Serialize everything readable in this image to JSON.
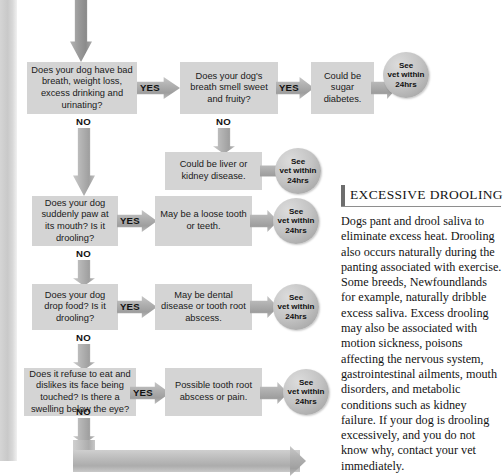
{
  "page": {
    "background_color": "#ffffff",
    "box_color": "#d4d4d4",
    "arrow_color": "#aeaeae",
    "circle_color": "#c0c0c0"
  },
  "flowchart": {
    "entry_arrow_label": "",
    "questions": [
      {
        "id": "q1",
        "text": "Does your dog have bad breath, weight loss, excess drinking and urinating?",
        "yes_label": "YES",
        "no_label": "NO"
      },
      {
        "id": "q2",
        "text": "Does your dog's breath smell sweet and fruity?",
        "yes_label": "YES",
        "no_label": "NO"
      },
      {
        "id": "q3",
        "text": "Does your dog suddenly paw at its mouth? Is it drooling?",
        "yes_label": "YES",
        "no_label": "NO"
      },
      {
        "id": "q4",
        "text": "Does your dog drop food? Is it drooling?",
        "yes_label": "YES",
        "no_label": "NO"
      },
      {
        "id": "q5",
        "text": "Does it refuse to eat and dislikes its face being touched? Is there a swelling below the eye?",
        "yes_label": "YES",
        "no_label": "NO"
      }
    ],
    "diagnoses": [
      {
        "id": "d1",
        "text": "Could be sugar diabetes."
      },
      {
        "id": "d2",
        "text": "Could be liver or kidney disease."
      },
      {
        "id": "d3",
        "text": "May be a loose tooth or teeth."
      },
      {
        "id": "d4",
        "text": "May be dental disease or tooth root abscess."
      },
      {
        "id": "d5",
        "text": "Possible tooth root abscess or pain."
      }
    ],
    "outcomes": [
      {
        "id": "o1",
        "text": "See\nvet within\n24hrs"
      },
      {
        "id": "o2",
        "text": "See\nvet within\n24hrs"
      },
      {
        "id": "o3",
        "text": "See\nvet within\n24hrs"
      },
      {
        "id": "o4",
        "text": "See\nvet within\n24hrs"
      },
      {
        "id": "o5",
        "text": "See\nvet within\n24hrs"
      }
    ],
    "outcome_lines": [
      "See",
      "vet within",
      "24hrs"
    ]
  },
  "article": {
    "title": "EXCESSIVE DROOLING",
    "body": "Dogs pant and drool saliva to eliminate excess heat. Drooling also occurs naturally during the panting associated with exercise. Some breeds, Newfoundlands for example, naturally dribble excess saliva. Excess drooling may also be associated with motion sickness, poisons affecting the nervous system, gastrointestinal ailments, mouth disorders, and metabolic conditions such as kidney failure. If your dog is drooling excessively, and you do not know why, contact your vet immediately."
  }
}
